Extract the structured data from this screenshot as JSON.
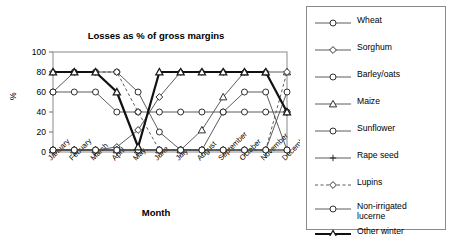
{
  "chart_data": {
    "type": "line",
    "title": "Losses as % of gross margins",
    "xlabel": "Month",
    "ylabel": "%",
    "categories": [
      "January",
      "Febuary",
      "March",
      "April",
      "May",
      "June",
      "July",
      "August",
      "September",
      "October",
      "November",
      "December"
    ],
    "ylim": [
      0,
      100
    ],
    "yticks": [
      0,
      20,
      40,
      60,
      80,
      100
    ],
    "grid": false,
    "legend_position": "right-outside",
    "series": [
      {
        "name": "Wheat",
        "marker": "circle",
        "line": "solid",
        "weight": "normal",
        "values": [
          60,
          80,
          80,
          80,
          60,
          20,
          2,
          2,
          2,
          2,
          2,
          60
        ]
      },
      {
        "name": "Sorghum",
        "marker": "diamond",
        "line": "solid",
        "weight": "normal",
        "values": [
          2,
          2,
          2,
          5,
          22,
          55,
          80,
          80,
          80,
          80,
          80,
          40
        ]
      },
      {
        "name": "Barley/oats",
        "marker": "circle",
        "line": "solid",
        "weight": "normal",
        "values": [
          60,
          60,
          60,
          40,
          40,
          40,
          40,
          40,
          40,
          40,
          40,
          40
        ]
      },
      {
        "name": "Maize",
        "marker": "triangle",
        "line": "solid",
        "weight": "normal",
        "values": [
          2,
          2,
          2,
          2,
          2,
          2,
          2,
          22,
          55,
          80,
          80,
          80
        ]
      },
      {
        "name": "Sunflower",
        "marker": "circle",
        "line": "solid",
        "weight": "normal",
        "values": [
          2,
          2,
          2,
          2,
          2,
          2,
          2,
          2,
          40,
          60,
          60,
          2
        ]
      },
      {
        "name": "Rape seed",
        "marker": "plus",
        "line": "solid",
        "weight": "normal",
        "values": [
          2,
          2,
          2,
          2,
          2,
          2,
          2,
          2,
          2,
          2,
          2,
          2
        ]
      },
      {
        "name": "Lupins",
        "marker": "diamond",
        "line": "dashed",
        "weight": "normal",
        "values": [
          80,
          80,
          80,
          80,
          40,
          2,
          2,
          2,
          2,
          2,
          2,
          80
        ]
      },
      {
        "name": "Non-irrigated\nlucerne",
        "marker": "circle",
        "line": "solid",
        "weight": "normal",
        "values": [
          2,
          2,
          2,
          2,
          2,
          2,
          2,
          2,
          2,
          2,
          2,
          2
        ]
      },
      {
        "name": "Other winter\ncrops",
        "marker": "triangle",
        "line": "solid",
        "weight": "bold",
        "values": [
          80,
          80,
          80,
          60,
          5,
          80,
          80,
          80,
          80,
          80,
          80,
          40
        ]
      }
    ]
  },
  "legend": {
    "items": [
      {
        "label": "Wheat"
      },
      {
        "label": "Sorghum"
      },
      {
        "label": "Barley/oats"
      },
      {
        "label": "Maize"
      },
      {
        "label": "Sunflower"
      },
      {
        "label": "Rape seed"
      },
      {
        "label": "Lupins"
      },
      {
        "label": "Non-irrigated\nlucerne"
      },
      {
        "label": "Other winter\ncrops"
      }
    ]
  }
}
